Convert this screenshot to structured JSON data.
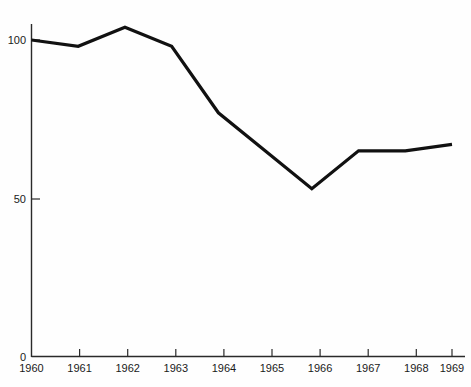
{
  "chart_data": {
    "type": "line",
    "title": "",
    "subtitle": "",
    "xlabel": "",
    "ylabel": "",
    "categories": [
      "1960",
      "1961",
      "1962",
      "1963",
      "1964",
      "1965",
      "1966",
      "1967",
      "1968",
      "1969"
    ],
    "x": [
      1960,
      1961,
      1962,
      1963,
      1964,
      1965,
      1966,
      1967,
      1968,
      1969
    ],
    "values": [
      100,
      98,
      104,
      98,
      77,
      65,
      53,
      65,
      65,
      67
    ],
    "series": [
      {
        "name": "index",
        "values": [
          100,
          98,
          104,
          98,
          77,
          65,
          53,
          65,
          65,
          67
        ]
      }
    ],
    "xlim": [
      1960,
      1969
    ],
    "ylim": [
      0,
      110
    ],
    "ytick_labels": [
      "0",
      "50",
      "100"
    ],
    "ytick_values": [
      0,
      50,
      100
    ],
    "xtick_labels": [
      "1960",
      "1961",
      "1962",
      "1963",
      "1964",
      "1965",
      "1966",
      "1967",
      "1968",
      "1969"
    ],
    "grid": false,
    "legend": false,
    "legend_position": "none",
    "annotations": [],
    "line_color": "#111111",
    "axis_color": "#2a2a2a",
    "background_color": "#fefefe"
  },
  "axis": {
    "y_labels": [
      {
        "text": "100",
        "value": 100
      },
      {
        "text": "50",
        "value": 50
      },
      {
        "text": "0",
        "value": 0
      }
    ],
    "x_labels": [
      {
        "text": "1960",
        "value": 1960
      },
      {
        "text": "1961",
        "value": 1961
      },
      {
        "text": "1962",
        "value": 1962
      },
      {
        "text": "1963",
        "value": 1963
      },
      {
        "text": "1964",
        "value": 1964
      },
      {
        "text": "1965",
        "value": 1965
      },
      {
        "text": "1966",
        "value": 1966
      },
      {
        "text": "1967",
        "value": 1967
      },
      {
        "text": "1968",
        "value": 1968
      },
      {
        "text": "1969",
        "value": 1969
      }
    ]
  }
}
